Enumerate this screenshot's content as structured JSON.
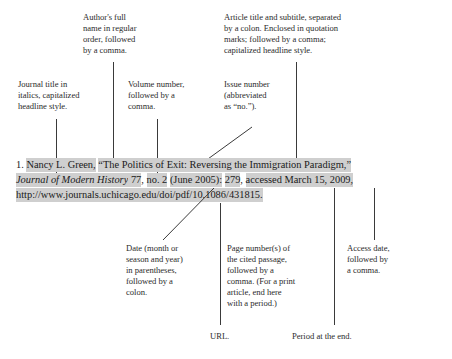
{
  "page": {
    "background_color": "#ffffff",
    "text_color": "#231f20",
    "highlight_color": "#cfcfcf",
    "leader_line_color": "#3a3a3a"
  },
  "annotations_top": [
    {
      "id": "author",
      "label": "Author's full\nname in regular\norder, followed\nby a comma.",
      "lines": [
        "Author's full",
        "name in regular",
        "order, followed",
        "by a comma."
      ]
    },
    {
      "id": "article-title",
      "label": "Article title and subtitle, separated by a colon. Enclosed in quotation marks; followed by a comma; capitalized headline style.",
      "lines": [
        "Article title and subtitle, separated",
        "by a colon. Enclosed in quotation",
        "marks; followed by a comma;",
        "capitalized headline style."
      ]
    },
    {
      "id": "journal-title",
      "label": "Journal title in italics, capitalized headline style.",
      "lines": [
        "Journal title in",
        "italics, capitalized",
        "headline style."
      ]
    },
    {
      "id": "volume-number",
      "label": "Volume number, followed by a comma.",
      "lines": [
        "Volume number,",
        "followed by a",
        "comma."
      ]
    },
    {
      "id": "issue-number",
      "label": "Issue number (abbreviated as “no.”).",
      "lines": [
        "Issue number",
        "(abbreviated",
        "as “no.”)."
      ]
    }
  ],
  "annotations_bottom": [
    {
      "id": "date",
      "label": "Date (month or season and year) in parentheses, followed by a colon.",
      "lines": [
        "Date (month or",
        "season and year)",
        "in parentheses,",
        "followed by a",
        "colon."
      ]
    },
    {
      "id": "page-numbers",
      "label": "Page number(s) of the cited passage, followed by a comma. (For a print article, end here with a period.)",
      "lines": [
        "Page number(s) of",
        "the cited passage,",
        "followed by a",
        "comma. (For a print",
        "article, end here",
        "with a period.)"
      ]
    },
    {
      "id": "access-date",
      "label": "Access date, followed by a comma.",
      "lines": [
        "Access date,",
        "followed by",
        "a comma."
      ]
    },
    {
      "id": "url",
      "label": "URL.",
      "lines": [
        "URL."
      ]
    },
    {
      "id": "period",
      "label": "Period at the end.",
      "lines": [
        "Period at the end."
      ]
    }
  ],
  "citation": {
    "note_number": "1.",
    "line1": {
      "author": "Nancy L. Green,",
      "title": "“The Politics of Exit: Reversing the Immigration Paradigm,”"
    },
    "line2": {
      "journal": "Journal of Modern History",
      "volume": "77",
      "comma_after_volume": ",",
      "issue": "no. 2",
      "date": "(June 2005):",
      "pages": "279",
      "comma_after_pages": ",",
      "access": "accessed March 15, 2009,"
    },
    "line3": {
      "url": "http://www.journals.uchicago.edu/doi/pdf/10.1086/431815",
      "period": "."
    }
  }
}
